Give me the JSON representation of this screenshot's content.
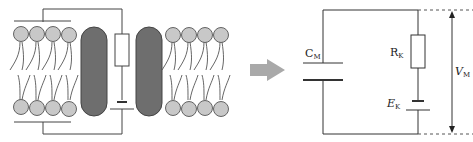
{
  "figure": {
    "left_panel": {
      "description": "Lipid bilayer membrane with two ion channel proteins and embedded circuit",
      "colors": {
        "lipid_head": "#c8c8c8",
        "lipid_stroke": "#555555",
        "protein_fill": "#6e6e6e",
        "protein_stroke": "#444444",
        "wire": "#444444"
      }
    },
    "arrow": {
      "icon": "right-arrow-icon",
      "color": "#a9a9a9"
    },
    "right_panel": {
      "capacitor_label": "C",
      "capacitor_sub": "M",
      "resistor_label": "R",
      "resistor_sub": "K",
      "battery_label": "E",
      "battery_sub": "K",
      "voltage_label": "V",
      "voltage_sub": "M"
    }
  }
}
